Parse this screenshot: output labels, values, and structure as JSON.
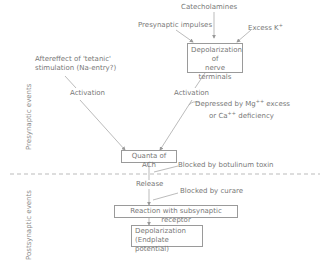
{
  "diagram": {
    "nodes": {
      "catecholamines": "Catecholamines",
      "presynaptic_impulses": "Presynaptic impulses",
      "excess_k": "Excess K",
      "excess_k_sup": "+",
      "depolarization_terminals_l1": "Depolarization of",
      "depolarization_terminals_l2": "nerve terminals",
      "aftereffect_l1": "Aftereffect of 'tetanic'",
      "aftereffect_l2": "stimulation (Na-entry?)",
      "activation_left": "Activation",
      "activation_right": "Activation",
      "depressed_l1_a": "Depressed by Mg",
      "depressed_l1_sup": "++",
      "depressed_l1_b": " excess",
      "depressed_l2_a": "or Ca",
      "depressed_l2_sup": "++",
      "depressed_l2_b": " deficiency",
      "quanta": "Quanta of ACh",
      "blocked_botulinum": "Blocked by botulinum toxin",
      "release": "Release",
      "blocked_curare": "Blocked by curare",
      "reaction": "Reaction with subsynaptic receptor",
      "depolarization_end_l1": "Depolarization",
      "depolarization_end_l2": "(Endplate potential)"
    },
    "sections": {
      "presynaptic": "Presynaptic events",
      "postsynaptic": "Postsynaptic events"
    },
    "colors": {
      "line": "#9a9a9a",
      "text": "#777777"
    }
  }
}
